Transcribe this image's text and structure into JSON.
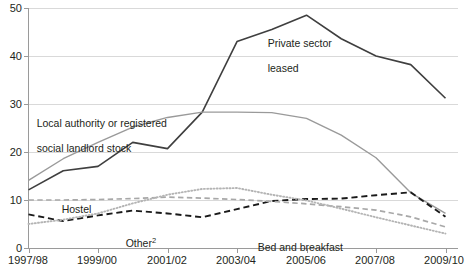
{
  "chart_data": {
    "type": "line",
    "title": "",
    "subtitle": "",
    "xlabel": "",
    "ylabel": "",
    "x": [
      "1997/98",
      "1998/99",
      "1999/00",
      "2000/01",
      "2001/02",
      "2002/03",
      "2003/04",
      "2004/05",
      "2005/06",
      "2006/07",
      "2007/08",
      "2008/09",
      "2009/10"
    ],
    "tick_labels_x": [
      "1997/98",
      "1999/00",
      "2001/02",
      "2003/04",
      "2005/06",
      "2007/08",
      "2009/10"
    ],
    "tick_labels_y": [
      "0",
      "10",
      "20",
      "30",
      "40",
      "50"
    ],
    "ylim": [
      0,
      50
    ],
    "ytick_step": 10,
    "grid": "horizontal",
    "legend": "inline-annotations",
    "series": [
      {
        "name": "Private sector leased",
        "style": "solid",
        "color": "#3f3f3f",
        "width": 1.6,
        "values": [
          12.1,
          16.1,
          17.0,
          22.0,
          20.7,
          28.3,
          43.0,
          45.5,
          48.5,
          43.6,
          40.0,
          38.2,
          31.2
        ]
      },
      {
        "name": "Local authority or registered social landlord stock",
        "style": "solid",
        "color": "#9a9a9a",
        "width": 1.4,
        "values": [
          14.1,
          18.6,
          22.0,
          25.2,
          27.2,
          28.3,
          28.3,
          28.2,
          27.0,
          23.5,
          18.8,
          11.5,
          7.2
        ]
      },
      {
        "name": "Other",
        "label_suffix": "2",
        "style": "dashed",
        "color": "#1a1a1a",
        "width": 1.9,
        "values": [
          7.0,
          5.6,
          6.8,
          7.8,
          7.2,
          6.4,
          8.1,
          9.8,
          10.2,
          10.3,
          11.0,
          11.6,
          6.5
        ]
      },
      {
        "name": "Hostel",
        "style": "dashed",
        "color": "#a8a8a8",
        "width": 1.7,
        "values": [
          10.0,
          10.0,
          10.1,
          10.3,
          10.6,
          10.4,
          10.1,
          9.7,
          9.2,
          8.6,
          7.9,
          6.5,
          4.4
        ]
      },
      {
        "name": "Bed and breakfast",
        "style": "dotted",
        "color": "#b4b4b4",
        "width": 1.9,
        "values": [
          5.0,
          5.9,
          7.2,
          9.3,
          11.1,
          12.3,
          12.5,
          11.1,
          9.9,
          8.2,
          6.4,
          4.7,
          3.0
        ]
      }
    ],
    "annotations": [
      {
        "name": "private-sector-leased",
        "text": "Private sector\nleased"
      },
      {
        "name": "la-rsl-stock",
        "text": "Local authority or registered\nsocial landlord stock"
      },
      {
        "name": "hostel",
        "text": "Hostel"
      },
      {
        "name": "other",
        "text": "Other"
      },
      {
        "name": "bed-and-breakfast",
        "text": "Bed and breakfast"
      }
    ]
  },
  "axis": {
    "y_ticks": [
      "50",
      "40",
      "30",
      "20",
      "10",
      "0"
    ],
    "x_ticks": [
      "1997/98",
      "1999/00",
      "2001/02",
      "2003/04",
      "2005/06",
      "2007/08",
      "2009/10"
    ]
  },
  "labels": {
    "private_line1": "Private sector",
    "private_line2": "leased",
    "la_line1": "Local authority or registered",
    "la_line2": "social landlord stock",
    "hostel": "Hostel",
    "other": "Other",
    "other_sup": "2",
    "bandb": "Bed and breakfast"
  },
  "colors": {
    "grid": "#d9d9d9",
    "axis": "#9a9a9a",
    "text": "#231f20",
    "private_sector_leased": "#3f3f3f",
    "la_rsl_stock": "#9a9a9a",
    "other": "#1a1a1a",
    "hostel": "#a8a8a8",
    "bed_and_breakfast": "#b4b4b4"
  }
}
